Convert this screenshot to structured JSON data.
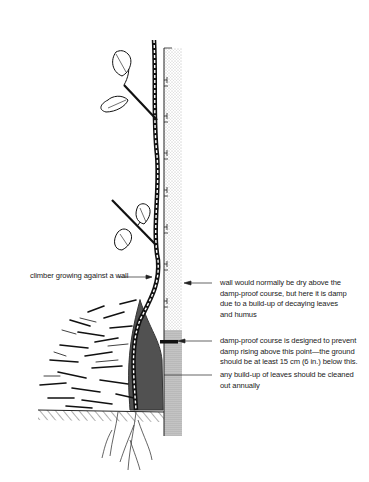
{
  "figure": {
    "labels": [
      {
        "id": "climber",
        "text": "climber growing against a wall"
      },
      {
        "id": "wall-damp",
        "lines": [
          "wall would normally be dry above the",
          "damp-proof course, but here it is damp",
          "due to a build-up of decaying leaves",
          "and humus"
        ]
      },
      {
        "id": "dpc",
        "lines": [
          "damp-proof course is designed to prevent",
          "damp rising above this point—the ground",
          "should be at least 15 cm (6 in.) below this."
        ]
      },
      {
        "id": "cleaning",
        "lines": [
          "any build-up of leaves should be cleaned",
          "out annually"
        ]
      }
    ]
  }
}
